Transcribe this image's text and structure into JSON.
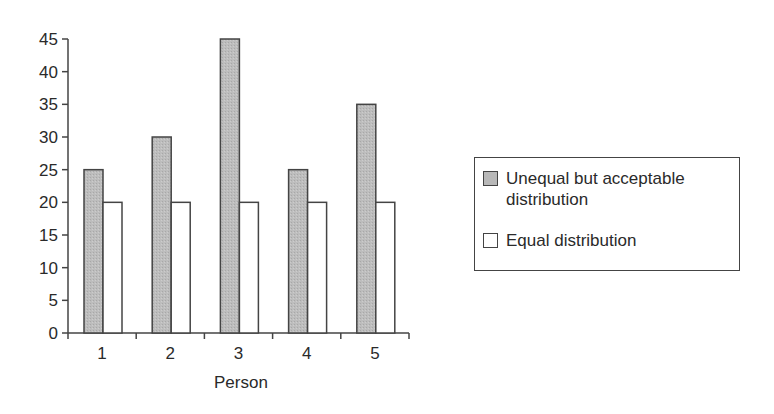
{
  "chart_data": {
    "type": "bar",
    "title": "",
    "xlabel": "Person",
    "ylabel": "",
    "categories": [
      "1",
      "2",
      "3",
      "4",
      "5"
    ],
    "series": [
      {
        "name": "Unequal but acceptable distribution",
        "values": [
          25,
          30,
          45,
          25,
          35
        ],
        "color": "#b8b8b8"
      },
      {
        "name": "Equal distribution",
        "values": [
          20,
          20,
          20,
          20,
          20
        ],
        "color": "#ffffff"
      }
    ],
    "ylim": [
      0,
      45
    ],
    "yticks": [
      0,
      5,
      10,
      15,
      20,
      25,
      30,
      35,
      40,
      45
    ],
    "grid": false,
    "legend_position": "right"
  },
  "legend": {
    "items": [
      {
        "label": "Unequal but acceptable distribution",
        "color": "#b8b8b8"
      },
      {
        "label": "Equal distribution",
        "color": "#ffffff"
      }
    ]
  },
  "axis": {
    "x_title": "Person"
  }
}
